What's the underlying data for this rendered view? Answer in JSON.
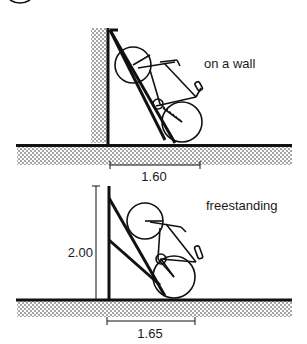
{
  "figure": {
    "panels": [
      {
        "id": "wall",
        "label": "on a wall",
        "dimension_width": "1.60"
      },
      {
        "id": "freestanding",
        "label": "freestanding",
        "dimension_width": "1.65",
        "dimension_height": "2.00"
      }
    ]
  },
  "colors": {
    "ink": "#111111",
    "background": "#ffffff"
  }
}
